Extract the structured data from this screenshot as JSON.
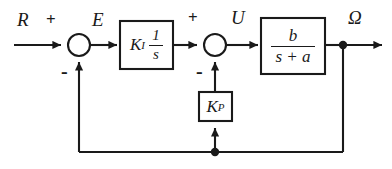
{
  "diagram": {
    "type": "control-system-block-diagram",
    "stroke_color": "#1a1a1a",
    "background_color": "#ffffff",
    "signals": {
      "reference": "R",
      "error": "E",
      "control": "U",
      "output": "Ω"
    },
    "signs": {
      "sum1_positive": "+",
      "sum1_negative": "-",
      "sum2_positive": "+",
      "sum2_negative": "-"
    },
    "blocks": [
      {
        "name": "integral-gain-block",
        "gain": "K",
        "gain_subscript": "I",
        "transfer_numerator": "1",
        "transfer_denominator": "s",
        "expression": "K_I · 1/s"
      },
      {
        "name": "plant-block",
        "transfer_numerator": "b",
        "transfer_denominator": "s + a",
        "expression": "b/(s+a)"
      },
      {
        "name": "proportional-gain-block",
        "gain": "K",
        "gain_subscript": "P",
        "expression": "K_P"
      }
    ],
    "junctions": [
      {
        "name": "summing-junction-1",
        "inputs": [
          "R",
          "outer-feedback"
        ],
        "output": "E"
      },
      {
        "name": "summing-junction-2",
        "inputs": [
          "integral-path",
          "inner-feedback"
        ],
        "output": "U"
      }
    ],
    "nodes": [
      {
        "name": "output-takeoff-node"
      },
      {
        "name": "feedback-branch-node"
      }
    ]
  }
}
